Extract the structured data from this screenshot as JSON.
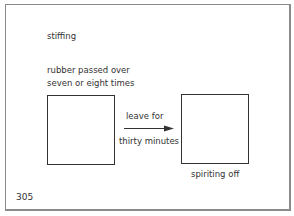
{
  "labels": {
    "stiffing": "stiffing",
    "rubber_line1": "rubber passed over",
    "rubber_line2": "seven or eight times",
    "leave_for": "leave for",
    "thirty_minutes": "thirty minutes",
    "spiriting_off": "spiriting off",
    "page_number": "305"
  }
}
